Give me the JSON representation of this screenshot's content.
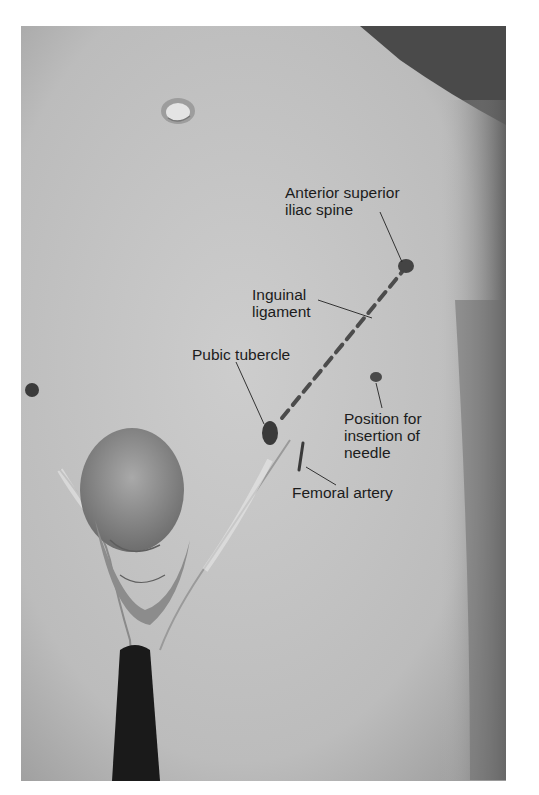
{
  "figure": {
    "type": "anatomical photograph (grayscale) with annotation labels",
    "background_color": "#ffffff",
    "photo_tone": "#bdbdbd",
    "labels": [
      {
        "id": "asis",
        "lines": [
          "Anterior superior",
          "iliac spine"
        ],
        "x": 285,
        "y": 192
      },
      {
        "id": "inguinal",
        "lines": [
          "Inguinal",
          "ligament"
        ],
        "x": 250,
        "y": 290
      },
      {
        "id": "pubic",
        "lines": [
          "Pubic tubercle"
        ],
        "x": 192,
        "y": 350
      },
      {
        "id": "needle",
        "lines": [
          "Position for",
          "insertion of",
          "needle"
        ],
        "x": 344,
        "y": 410
      },
      {
        "id": "femoral",
        "lines": [
          "Femoral artery"
        ],
        "x": 292,
        "y": 486
      }
    ],
    "markers": [
      {
        "id": "asis-mark",
        "cx": 406,
        "cy": 266,
        "rx": 8,
        "ry": 7
      },
      {
        "id": "pubic-mark",
        "cx": 270,
        "cy": 433,
        "rx": 8,
        "ry": 12
      },
      {
        "id": "needle-mark",
        "cx": 376,
        "cy": 377,
        "rx": 6,
        "ry": 5
      }
    ]
  }
}
